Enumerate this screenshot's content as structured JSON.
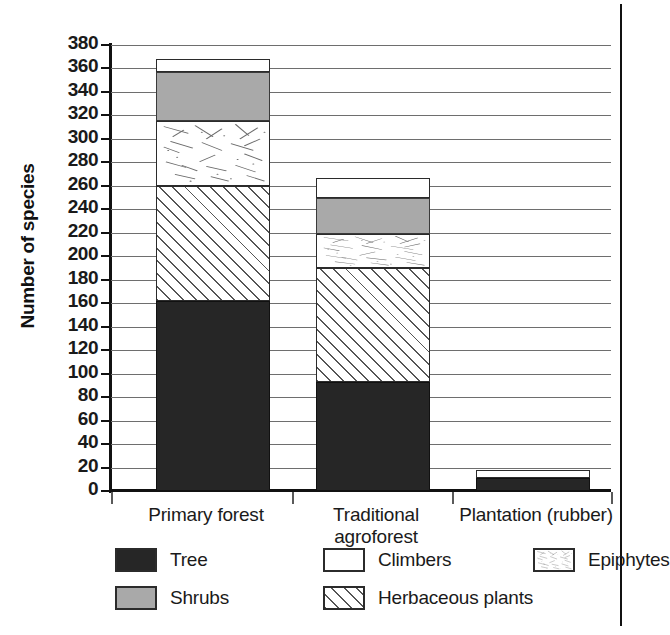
{
  "chart_data": {
    "type": "bar",
    "subtype": "stacked-bar",
    "title": "",
    "xlabel": "",
    "ylabel": "Number of species",
    "ylim": [
      0,
      380
    ],
    "ytick_step": 20,
    "yticks": [
      0,
      20,
      40,
      60,
      80,
      100,
      120,
      140,
      160,
      180,
      200,
      220,
      240,
      260,
      280,
      300,
      320,
      340,
      360,
      380
    ],
    "ytick_labels": [
      "0",
      "20",
      "40",
      "60",
      "80",
      "100",
      "120",
      "140",
      "160",
      "180",
      "200",
      "220",
      "240",
      "260",
      "280",
      "300",
      "320",
      "340",
      "360",
      "380"
    ],
    "grid": true,
    "grid_axis": "y",
    "legend_position": "bottom",
    "categories": [
      "Primary forest",
      "Traditional agroforest",
      "Plantation (rubber)"
    ],
    "category_labels": [
      [
        "Primary forest"
      ],
      [
        "Traditional",
        "agroforest"
      ],
      [
        "Plantation (rubber)"
      ]
    ],
    "stack_order": [
      "Tree",
      "Herbaceous plants",
      "Epiphytes",
      "Shrubs",
      "Climbers"
    ],
    "series": [
      {
        "name": "Tree",
        "pattern": "solid-black",
        "color": "#262626",
        "values": [
          162,
          93,
          11
        ]
      },
      {
        "name": "Herbaceous plants",
        "pattern": "diagonal-hatch",
        "color": "#ffffff",
        "values": [
          98,
          97,
          0
        ]
      },
      {
        "name": "Epiphytes",
        "pattern": "scattered-dashes",
        "color": "#ffffff",
        "values": [
          55,
          29,
          0
        ]
      },
      {
        "name": "Shrubs",
        "pattern": "solid-gray",
        "color": "#a9a9a9",
        "values": [
          42,
          31,
          0
        ]
      },
      {
        "name": "Climbers",
        "pattern": "open-white",
        "color": "#ffffff",
        "values": [
          11,
          17,
          7
        ]
      }
    ],
    "cumulative_tops": {
      "Primary forest": {
        "Tree": 162,
        "Herbaceous plants": 260,
        "Epiphytes": 315,
        "Shrubs": 357,
        "Climbers": 368
      },
      "Traditional agroforest": {
        "Tree": 93,
        "Herbaceous plants": 190,
        "Epiphytes": 219,
        "Shrubs": 250,
        "Climbers": 267
      },
      "Plantation (rubber)": {
        "Tree": 11,
        "Herbaceous plants": 11,
        "Epiphytes": 11,
        "Shrubs": 11,
        "Climbers": 18
      }
    },
    "totals": [
      368,
      267,
      18
    ]
  },
  "legend": {
    "items": [
      {
        "label": "Tree",
        "swatch": "solid-black"
      },
      {
        "label": "Climbers",
        "swatch": "open-white"
      },
      {
        "label": "Epiphytes",
        "swatch": "scattered-dashes"
      },
      {
        "label": "Shrubs",
        "swatch": "solid-gray"
      },
      {
        "label": "Herbaceous plants",
        "swatch": "diagonal-hatch"
      }
    ]
  },
  "colors": {
    "tree": "#262626",
    "shrubs": "#a9a9a9",
    "climbers": "#ffffff",
    "outline": "#2b2b2b",
    "gridline": "#6e6e6e",
    "axis": "#111111"
  }
}
